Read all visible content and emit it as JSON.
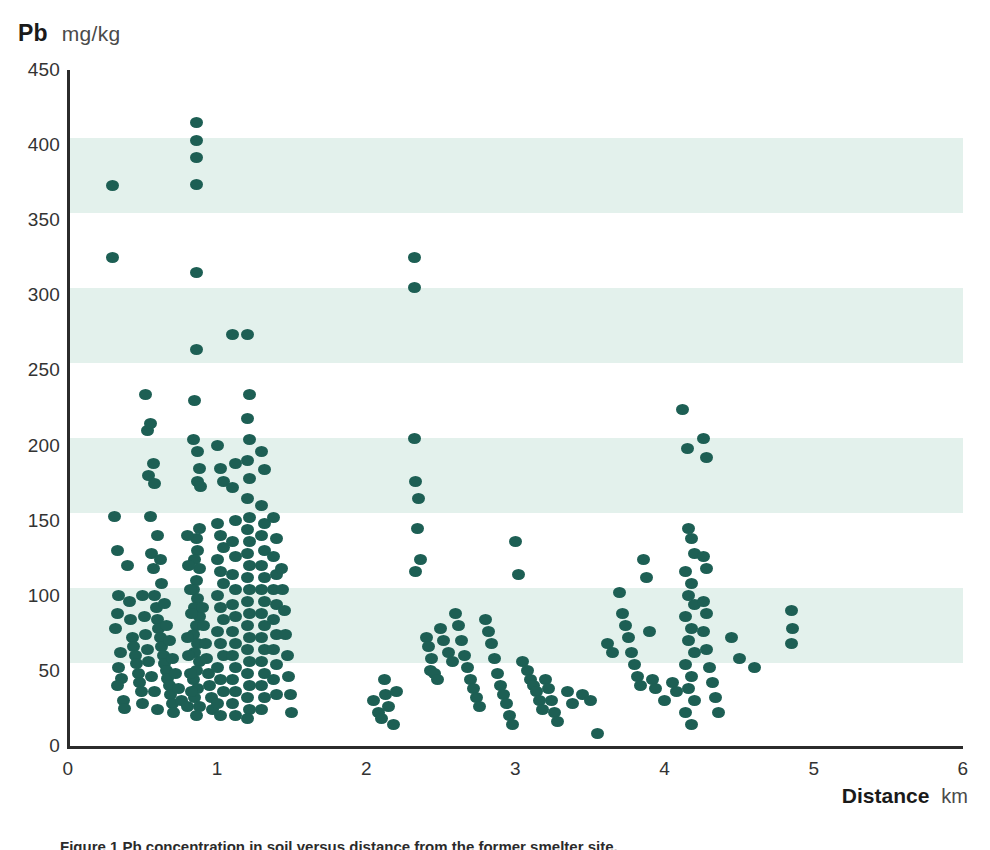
{
  "header": {
    "y_variable": "Pb",
    "y_unit": "mg/kg"
  },
  "footer": {
    "x_variable": "Distance",
    "x_unit": "km",
    "caption": "Figure 1  Pb concentration in soil versus distance from the former smelter site."
  },
  "colors": {
    "dot": "#1d5f54",
    "band": "#e3f1ec",
    "axis": "#2b2b2b",
    "text": "#333333"
  },
  "chart_data": {
    "type": "scatter",
    "title": "",
    "xlabel": "Distance",
    "xunit": "km",
    "ylabel": "Pb",
    "yunit": "mg/kg",
    "xlim": [
      0,
      6
    ],
    "ylim": [
      0,
      450
    ],
    "xticks": [
      0,
      1,
      2,
      3,
      4,
      5,
      6
    ],
    "yticks": [
      0,
      50,
      100,
      150,
      200,
      250,
      300,
      350,
      400,
      450
    ],
    "grid": false,
    "legend": null,
    "banding": {
      "note": "Alternating horizontal shaded bands each 50 mg/kg tall",
      "ranges": [
        [
          55,
          105
        ],
        [
          155,
          205
        ],
        [
          255,
          305
        ],
        [
          355,
          405
        ]
      ]
    },
    "marker": {
      "shape": "ellipse",
      "width_px": 13,
      "height_px": 11,
      "color": "#1d5f54"
    },
    "points": [
      [
        0.3,
        373
      ],
      [
        0.3,
        325
      ],
      [
        0.31,
        153
      ],
      [
        0.33,
        130
      ],
      [
        0.34,
        100
      ],
      [
        0.33,
        88
      ],
      [
        0.32,
        78
      ],
      [
        0.35,
        62
      ],
      [
        0.34,
        52
      ],
      [
        0.36,
        45
      ],
      [
        0.33,
        40
      ],
      [
        0.37,
        30
      ],
      [
        0.38,
        25
      ],
      [
        0.4,
        120
      ],
      [
        0.41,
        96
      ],
      [
        0.42,
        84
      ],
      [
        0.43,
        72
      ],
      [
        0.44,
        66
      ],
      [
        0.45,
        60
      ],
      [
        0.46,
        55
      ],
      [
        0.47,
        48
      ],
      [
        0.48,
        42
      ],
      [
        0.49,
        36
      ],
      [
        0.5,
        28
      ],
      [
        0.52,
        234
      ],
      [
        0.53,
        210
      ],
      [
        0.54,
        180
      ],
      [
        0.55,
        153
      ],
      [
        0.56,
        128
      ],
      [
        0.57,
        118
      ],
      [
        0.58,
        100
      ],
      [
        0.59,
        92
      ],
      [
        0.6,
        84
      ],
      [
        0.61,
        78
      ],
      [
        0.62,
        72
      ],
      [
        0.63,
        66
      ],
      [
        0.64,
        60
      ],
      [
        0.65,
        55
      ],
      [
        0.66,
        50
      ],
      [
        0.67,
        45
      ],
      [
        0.68,
        40
      ],
      [
        0.69,
        34
      ],
      [
        0.7,
        28
      ],
      [
        0.71,
        22
      ],
      [
        0.55,
        215
      ],
      [
        0.57,
        188
      ],
      [
        0.58,
        175
      ],
      [
        0.6,
        140
      ],
      [
        0.62,
        124
      ],
      [
        0.63,
        108
      ],
      [
        0.65,
        95
      ],
      [
        0.66,
        80
      ],
      [
        0.68,
        70
      ],
      [
        0.7,
        58
      ],
      [
        0.72,
        48
      ],
      [
        0.74,
        38
      ],
      [
        0.76,
        30
      ],
      [
        0.5,
        100
      ],
      [
        0.51,
        86
      ],
      [
        0.52,
        74
      ],
      [
        0.53,
        64
      ],
      [
        0.54,
        56
      ],
      [
        0.56,
        46
      ],
      [
        0.58,
        36
      ],
      [
        0.6,
        24
      ],
      [
        0.86,
        415
      ],
      [
        0.86,
        403
      ],
      [
        0.86,
        392
      ],
      [
        0.86,
        374
      ],
      [
        0.86,
        315
      ],
      [
        0.86,
        264
      ],
      [
        0.87,
        196
      ],
      [
        0.88,
        185
      ],
      [
        0.87,
        176
      ],
      [
        0.89,
        173
      ],
      [
        0.85,
        230
      ],
      [
        0.84,
        204
      ],
      [
        0.88,
        145
      ],
      [
        0.86,
        138
      ],
      [
        0.87,
        130
      ],
      [
        0.85,
        124
      ],
      [
        0.88,
        118
      ],
      [
        0.86,
        110
      ],
      [
        0.84,
        104
      ],
      [
        0.87,
        98
      ],
      [
        0.85,
        92
      ],
      [
        0.88,
        86
      ],
      [
        0.86,
        80
      ],
      [
        0.84,
        74
      ],
      [
        0.87,
        68
      ],
      [
        0.85,
        62
      ],
      [
        0.88,
        56
      ],
      [
        0.86,
        50
      ],
      [
        0.84,
        44
      ],
      [
        0.87,
        38
      ],
      [
        0.85,
        32
      ],
      [
        0.88,
        26
      ],
      [
        0.86,
        20
      ],
      [
        0.9,
        92
      ],
      [
        0.91,
        80
      ],
      [
        0.92,
        68
      ],
      [
        0.93,
        58
      ],
      [
        0.94,
        48
      ],
      [
        0.95,
        40
      ],
      [
        0.96,
        32
      ],
      [
        0.97,
        24
      ],
      [
        0.8,
        140
      ],
      [
        0.81,
        120
      ],
      [
        0.82,
        104
      ],
      [
        0.83,
        88
      ],
      [
        0.8,
        72
      ],
      [
        0.81,
        60
      ],
      [
        0.82,
        48
      ],
      [
        0.83,
        36
      ],
      [
        0.8,
        26
      ],
      [
        1.0,
        200
      ],
      [
        1.02,
        185
      ],
      [
        1.04,
        176
      ],
      [
        1.0,
        148
      ],
      [
        1.02,
        140
      ],
      [
        1.04,
        132
      ],
      [
        1.0,
        124
      ],
      [
        1.02,
        116
      ],
      [
        1.04,
        108
      ],
      [
        1.0,
        100
      ],
      [
        1.02,
        92
      ],
      [
        1.04,
        84
      ],
      [
        1.0,
        76
      ],
      [
        1.02,
        68
      ],
      [
        1.04,
        60
      ],
      [
        1.0,
        52
      ],
      [
        1.02,
        44
      ],
      [
        1.04,
        36
      ],
      [
        1.0,
        28
      ],
      [
        1.02,
        20
      ],
      [
        1.1,
        274
      ],
      [
        1.12,
        188
      ],
      [
        1.1,
        172
      ],
      [
        1.12,
        150
      ],
      [
        1.1,
        136
      ],
      [
        1.12,
        126
      ],
      [
        1.1,
        114
      ],
      [
        1.12,
        104
      ],
      [
        1.1,
        94
      ],
      [
        1.12,
        86
      ],
      [
        1.1,
        76
      ],
      [
        1.12,
        68
      ],
      [
        1.1,
        60
      ],
      [
        1.12,
        52
      ],
      [
        1.1,
        44
      ],
      [
        1.12,
        36
      ],
      [
        1.1,
        28
      ],
      [
        1.12,
        20
      ],
      [
        1.2,
        274
      ],
      [
        1.22,
        234
      ],
      [
        1.2,
        218
      ],
      [
        1.22,
        204
      ],
      [
        1.2,
        190
      ],
      [
        1.22,
        178
      ],
      [
        1.2,
        165
      ],
      [
        1.22,
        152
      ],
      [
        1.2,
        144
      ],
      [
        1.22,
        136
      ],
      [
        1.2,
        128
      ],
      [
        1.22,
        120
      ],
      [
        1.2,
        112
      ],
      [
        1.22,
        104
      ],
      [
        1.2,
        96
      ],
      [
        1.22,
        88
      ],
      [
        1.2,
        80
      ],
      [
        1.22,
        72
      ],
      [
        1.2,
        64
      ],
      [
        1.22,
        56
      ],
      [
        1.2,
        48
      ],
      [
        1.22,
        40
      ],
      [
        1.2,
        32
      ],
      [
        1.22,
        24
      ],
      [
        1.2,
        18
      ],
      [
        1.3,
        196
      ],
      [
        1.32,
        184
      ],
      [
        1.3,
        160
      ],
      [
        1.32,
        148
      ],
      [
        1.3,
        140
      ],
      [
        1.32,
        130
      ],
      [
        1.3,
        120
      ],
      [
        1.32,
        112
      ],
      [
        1.3,
        104
      ],
      [
        1.32,
        96
      ],
      [
        1.3,
        88
      ],
      [
        1.32,
        80
      ],
      [
        1.3,
        72
      ],
      [
        1.32,
        64
      ],
      [
        1.3,
        56
      ],
      [
        1.32,
        48
      ],
      [
        1.3,
        40
      ],
      [
        1.32,
        32
      ],
      [
        1.3,
        24
      ],
      [
        1.38,
        152
      ],
      [
        1.4,
        138
      ],
      [
        1.38,
        126
      ],
      [
        1.4,
        114
      ],
      [
        1.38,
        104
      ],
      [
        1.4,
        94
      ],
      [
        1.38,
        84
      ],
      [
        1.4,
        74
      ],
      [
        1.38,
        64
      ],
      [
        1.4,
        54
      ],
      [
        1.38,
        44
      ],
      [
        1.4,
        34
      ],
      [
        1.45,
        90
      ],
      [
        1.46,
        74
      ],
      [
        1.47,
        60
      ],
      [
        1.48,
        46
      ],
      [
        1.49,
        34
      ],
      [
        1.5,
        22
      ],
      [
        1.44,
        104
      ],
      [
        1.43,
        118
      ],
      [
        2.05,
        30
      ],
      [
        2.08,
        22
      ],
      [
        2.1,
        18
      ],
      [
        2.12,
        44
      ],
      [
        2.13,
        34
      ],
      [
        2.15,
        26
      ],
      [
        2.18,
        14
      ],
      [
        2.2,
        36
      ],
      [
        2.32,
        325
      ],
      [
        2.32,
        305
      ],
      [
        2.32,
        205
      ],
      [
        2.33,
        176
      ],
      [
        2.35,
        165
      ],
      [
        2.34,
        145
      ],
      [
        2.36,
        124
      ],
      [
        2.33,
        116
      ],
      [
        2.4,
        72
      ],
      [
        2.42,
        66
      ],
      [
        2.44,
        58
      ],
      [
        2.43,
        50
      ],
      [
        2.46,
        48
      ],
      [
        2.48,
        44
      ],
      [
        2.5,
        78
      ],
      [
        2.52,
        70
      ],
      [
        2.55,
        62
      ],
      [
        2.58,
        56
      ],
      [
        2.6,
        88
      ],
      [
        2.62,
        80
      ],
      [
        2.64,
        70
      ],
      [
        2.66,
        60
      ],
      [
        2.68,
        52
      ],
      [
        2.7,
        44
      ],
      [
        2.72,
        38
      ],
      [
        2.74,
        32
      ],
      [
        2.76,
        26
      ],
      [
        2.8,
        84
      ],
      [
        2.82,
        76
      ],
      [
        2.84,
        68
      ],
      [
        2.86,
        58
      ],
      [
        2.88,
        48
      ],
      [
        2.9,
        40
      ],
      [
        2.92,
        34
      ],
      [
        2.94,
        28
      ],
      [
        2.96,
        20
      ],
      [
        2.98,
        14
      ],
      [
        3.0,
        136
      ],
      [
        3.02,
        114
      ],
      [
        3.05,
        56
      ],
      [
        3.08,
        50
      ],
      [
        3.1,
        44
      ],
      [
        3.12,
        40
      ],
      [
        3.14,
        36
      ],
      [
        3.16,
        30
      ],
      [
        3.18,
        24
      ],
      [
        3.2,
        44
      ],
      [
        3.22,
        38
      ],
      [
        3.24,
        30
      ],
      [
        3.26,
        22
      ],
      [
        3.28,
        16
      ],
      [
        3.35,
        36
      ],
      [
        3.38,
        28
      ],
      [
        3.45,
        34
      ],
      [
        3.5,
        30
      ],
      [
        3.55,
        8
      ],
      [
        3.62,
        68
      ],
      [
        3.65,
        62
      ],
      [
        3.7,
        102
      ],
      [
        3.72,
        88
      ],
      [
        3.74,
        80
      ],
      [
        3.76,
        72
      ],
      [
        3.78,
        62
      ],
      [
        3.8,
        54
      ],
      [
        3.82,
        46
      ],
      [
        3.84,
        40
      ],
      [
        3.86,
        124
      ],
      [
        3.88,
        112
      ],
      [
        3.9,
        76
      ],
      [
        3.92,
        44
      ],
      [
        3.94,
        38
      ],
      [
        4.0,
        30
      ],
      [
        4.05,
        42
      ],
      [
        4.08,
        36
      ],
      [
        4.12,
        224
      ],
      [
        4.15,
        198
      ],
      [
        4.16,
        145
      ],
      [
        4.18,
        138
      ],
      [
        4.2,
        128
      ],
      [
        4.14,
        116
      ],
      [
        4.18,
        108
      ],
      [
        4.16,
        100
      ],
      [
        4.2,
        94
      ],
      [
        4.14,
        86
      ],
      [
        4.18,
        78
      ],
      [
        4.16,
        70
      ],
      [
        4.2,
        62
      ],
      [
        4.14,
        54
      ],
      [
        4.18,
        46
      ],
      [
        4.16,
        38
      ],
      [
        4.2,
        30
      ],
      [
        4.14,
        22
      ],
      [
        4.18,
        14
      ],
      [
        4.26,
        205
      ],
      [
        4.28,
        192
      ],
      [
        4.26,
        126
      ],
      [
        4.28,
        118
      ],
      [
        4.26,
        96
      ],
      [
        4.28,
        88
      ],
      [
        4.26,
        76
      ],
      [
        4.28,
        64
      ],
      [
        4.3,
        52
      ],
      [
        4.32,
        42
      ],
      [
        4.34,
        32
      ],
      [
        4.36,
        22
      ],
      [
        4.45,
        72
      ],
      [
        4.5,
        58
      ],
      [
        4.6,
        52
      ],
      [
        4.85,
        90
      ],
      [
        4.86,
        78
      ],
      [
        4.85,
        68
      ]
    ]
  }
}
